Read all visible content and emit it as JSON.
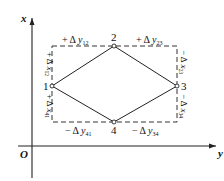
{
  "diagram": {
    "axes": {
      "vertical_label": "x",
      "horizontal_label": "y",
      "origin_label": "O"
    },
    "points": [
      {
        "id": "1",
        "label": "1"
      },
      {
        "id": "2",
        "label": "2"
      },
      {
        "id": "3",
        "label": "3"
      },
      {
        "id": "4",
        "label": "4"
      }
    ],
    "increments": {
      "top_left": {
        "sign": "+",
        "delta": "Δ",
        "var": "y",
        "sub": "12"
      },
      "top_right": {
        "sign": "+",
        "delta": "Δ",
        "var": "y",
        "sub": "23"
      },
      "bottom_left": {
        "sign": "−",
        "delta": "Δ",
        "var": "y",
        "sub": "41"
      },
      "bottom_right": {
        "sign": "−",
        "delta": "Δ",
        "var": "y",
        "sub": "34"
      },
      "left_upper": {
        "sign": "+",
        "delta": "Δ",
        "var": "x",
        "sub": "12"
      },
      "left_lower": {
        "sign": "+",
        "delta": "Δ",
        "var": "x",
        "sub": "41"
      },
      "right_upper": {
        "sign": "−",
        "delta": "Δ",
        "var": "x",
        "sub": "23"
      },
      "right_lower": {
        "sign": "−",
        "delta": "Δ",
        "var": "x",
        "sub": "34"
      }
    },
    "colors": {
      "line": "#222222",
      "background": "#ffffff"
    }
  }
}
